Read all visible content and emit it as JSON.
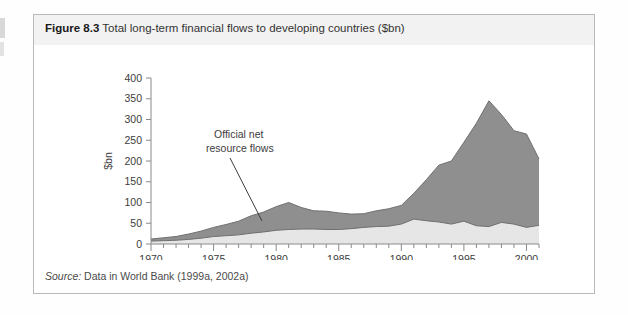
{
  "figure": {
    "number": "Figure 8.3",
    "caption": "Total long-term financial flows to developing countries ($bn)",
    "source_label": "Source:",
    "source_text": " Data in World Bank (1999a, 2002a)"
  },
  "colors": {
    "official_fill": "#e6e6e6",
    "private_fill": "#8f8f8f",
    "outline": "#6f6f6f",
    "axis": "#8a8a8a",
    "text": "#3c3c3c",
    "caption_band": "#f2f2f2",
    "border": "#b9b9b9"
  },
  "annotations": {
    "official": {
      "line1": "Official net",
      "line2": "resource flows"
    },
    "private": {
      "line1": "Private net",
      "line2": "resource flows"
    }
  },
  "chart_data": {
    "type": "area",
    "stacked": true,
    "title": "Total long-term financial flows to developing countries ($bn)",
    "xlabel": "Year",
    "ylabel": "$bn",
    "xlim": [
      1970,
      2001
    ],
    "ylim": [
      0,
      400
    ],
    "ytick_step": 50,
    "yticks": [
      0,
      50,
      100,
      150,
      200,
      250,
      300,
      350,
      400
    ],
    "xticks_major": [
      1970,
      1975,
      1980,
      1985,
      1990,
      1995,
      2000
    ],
    "xticks_minor_step": 1,
    "grid": false,
    "legend": "inline-annotations",
    "x": [
      1970,
      1971,
      1972,
      1973,
      1974,
      1975,
      1976,
      1977,
      1978,
      1979,
      1980,
      1981,
      1982,
      1983,
      1984,
      1985,
      1986,
      1987,
      1988,
      1989,
      1990,
      1991,
      1992,
      1993,
      1994,
      1995,
      1996,
      1997,
      1998,
      1999,
      2000,
      2001
    ],
    "series": [
      {
        "name": "Official net resource flows",
        "values": [
          7,
          8,
          9,
          11,
          14,
          18,
          20,
          22,
          26,
          29,
          33,
          35,
          36,
          36,
          35,
          35,
          37,
          40,
          42,
          43,
          48,
          60,
          56,
          53,
          48,
          55,
          44,
          42,
          52,
          48,
          40,
          45
        ]
      },
      {
        "name": "Private net resource flows",
        "values": [
          5,
          7,
          9,
          13,
          17,
          22,
          27,
          33,
          42,
          48,
          57,
          65,
          52,
          44,
          44,
          40,
          35,
          33,
          38,
          42,
          45,
          62,
          99,
          137,
          152,
          190,
          247,
          303,
          260,
          225,
          225,
          160
        ]
      }
    ],
    "totals": [
      12,
      15,
      18,
      24,
      31,
      40,
      47,
      55,
      68,
      77,
      90,
      100,
      88,
      80,
      79,
      75,
      72,
      73,
      80,
      85,
      93,
      122,
      155,
      190,
      200,
      245,
      291,
      345,
      312,
      273,
      265,
      205
    ],
    "peak": {
      "year": 1997,
      "value": 345
    }
  }
}
